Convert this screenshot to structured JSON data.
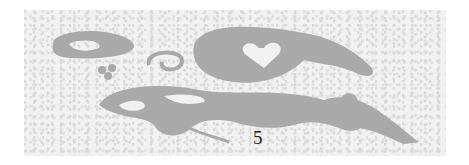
{
  "image": {
    "description": "Gray butterfly stencil on speckled white background",
    "caption_digit": "5",
    "colors": {
      "background": "#f1f1f1",
      "shape": "#a9a9a9",
      "digit": "#222222"
    }
  }
}
